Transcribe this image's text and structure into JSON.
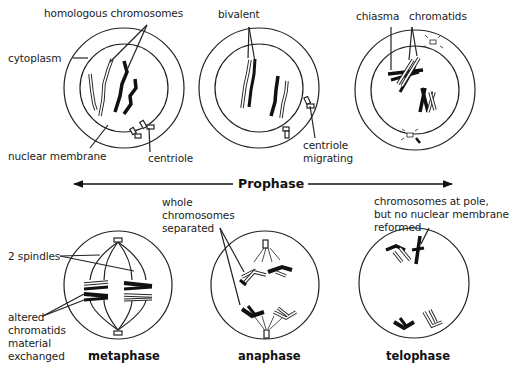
{
  "figure": {
    "colors": {
      "line": "#222222",
      "fill_dark": "#111111",
      "fill_light": "#ffffff",
      "background": "#ffffff"
    }
  },
  "prophase_arrow": {
    "label": "Prophase"
  },
  "cells": [
    {
      "id": "early-prophase",
      "labels": {
        "homologous": "homologous chromosomes",
        "cytoplasm": "cytoplasm",
        "nuclear_membrane": "nuclear membrane",
        "centriole": "centriole"
      }
    },
    {
      "id": "mid-prophase",
      "labels": {
        "bivalent": "bivalent",
        "centriole_migrating_1": "centriole",
        "centriole_migrating_2": "migrating"
      }
    },
    {
      "id": "late-prophase",
      "labels": {
        "chiasma": "chiasma",
        "chromatids": "chromatids"
      }
    },
    {
      "id": "metaphase",
      "phase_name": "metaphase",
      "labels": {
        "spindles": "2 spindles",
        "altered_1": "altered",
        "altered_2": "chromatids",
        "altered_3": "material",
        "altered_4": "exchanged"
      }
    },
    {
      "id": "anaphase",
      "phase_name": "anaphase",
      "labels": {
        "whole_1": "whole",
        "whole_2": "chromosomes",
        "whole_3": "separated"
      }
    },
    {
      "id": "telophase",
      "phase_name": "telophase",
      "labels": {
        "pole_1": "chromosomes at pole,",
        "pole_2": "but no nuclear membrane",
        "pole_3": "reformed"
      }
    }
  ]
}
